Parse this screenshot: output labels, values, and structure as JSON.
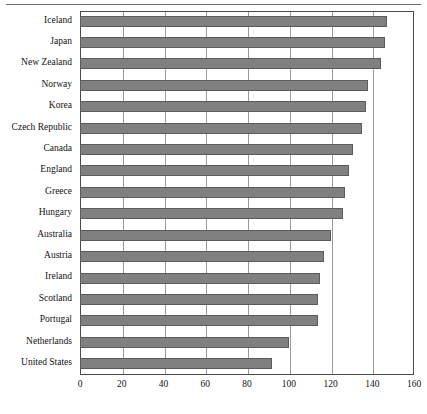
{
  "chart_data": {
    "type": "bar",
    "orientation": "horizontal",
    "title": "",
    "subtitle": "",
    "xlabel": "",
    "ylabel": "",
    "xlim": [
      0,
      160
    ],
    "xticks": [
      0,
      20,
      40,
      60,
      80,
      100,
      120,
      140,
      160
    ],
    "xtick_labels": [
      "0",
      "20",
      "40",
      "60",
      "80",
      "100",
      "120",
      "140",
      "160"
    ],
    "grid": "vertical",
    "legend": "none",
    "bar_color": "#808080",
    "bar_border_color": "#5b5b5b",
    "axis_color": "#4a4a4a",
    "gridline_color": "#9a9a9a",
    "categories": [
      "Iceland",
      "Japan",
      "New Zealand",
      "Norway",
      "Korea",
      "Czech Republic",
      "Canada",
      "England",
      "Greece",
      "Hungary",
      "Australia",
      "Austria",
      "Ireland",
      "Scotland",
      "Portugal",
      "Netherlands",
      "United States"
    ],
    "values": [
      147,
      146,
      144,
      138,
      137,
      135,
      131,
      129,
      127,
      126,
      120,
      117,
      115,
      114,
      114,
      100,
      92
    ]
  }
}
